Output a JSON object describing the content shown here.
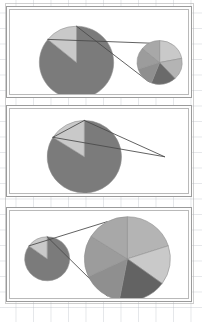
{
  "figure": {
    "width": 202,
    "height": 322,
    "background": "#ffffff",
    "grid_color": "#aab0ba",
    "panel_border_color": "#9b9b9b",
    "panel_inner_border_color": "#b9b9b9",
    "wedge_outline_color": "#8f8f8f",
    "leader_line_color": "#4a4a4a"
  },
  "palette": {
    "dark_gray": "#7b7b7b",
    "mid_gray": "#8f8f8f",
    "light_gray": "#c9c9c9",
    "lighter_gray": "#b4b4b4",
    "pale_gray": "#d6d6d6",
    "darkest_gray": "#6a6a6a",
    "very_dark_gray": "#636363"
  },
  "chart_data": [
    {
      "type": "pie",
      "panel": 1,
      "title": "Panel 1 — main pie with medium detail pie",
      "main_pie": {
        "name": "main",
        "center_x": 68,
        "center_y": 55,
        "radius": 38,
        "start_angle": -90,
        "slices": [
          {
            "label": "Remainder",
            "value": 86,
            "color": "#7b7b7b"
          },
          {
            "label": "Other",
            "value": 14,
            "color": "#c9c9c9"
          }
        ]
      },
      "detail_pie": {
        "name": "detail",
        "center_x": 153,
        "center_y": 55,
        "radius": 23,
        "start_angle": -90,
        "slices": [
          {
            "label": "A",
            "value": 22,
            "color": "#c9c9c9"
          },
          {
            "label": "B",
            "value": 16,
            "color": "#b4b4b4"
          },
          {
            "label": "C",
            "value": 18,
            "color": "#6a6a6a"
          },
          {
            "label": "D",
            "value": 14,
            "color": "#8f8f8f"
          },
          {
            "label": "E",
            "value": 16,
            "color": "#9c9c9c"
          },
          {
            "label": "F",
            "value": 14,
            "color": "#a8a8a8"
          }
        ]
      },
      "leader_lines": true,
      "legend": "none",
      "grid": false
    },
    {
      "type": "pie",
      "panel": 2,
      "title": "Panel 2 — main pie with collapsed detail pie",
      "main_pie": {
        "name": "main",
        "center_x": 76,
        "center_y": 50,
        "radius": 38,
        "start_angle": -90,
        "slices": [
          {
            "label": "Remainder",
            "value": 84,
            "color": "#7b7b7b"
          },
          {
            "label": "Other",
            "value": 16,
            "color": "#c9c9c9"
          }
        ]
      },
      "detail_pie": {
        "name": "detail",
        "center_x": 158,
        "center_y": 50,
        "radius": 0,
        "start_angle": -90,
        "slices": []
      },
      "leader_lines": true,
      "legend": "none",
      "grid": false
    },
    {
      "type": "pie",
      "panel": 3,
      "title": "Panel 3 — small main pie with large detail pie",
      "main_pie": {
        "name": "main",
        "center_x": 38,
        "center_y": 50,
        "radius": 23,
        "start_angle": -90,
        "slices": [
          {
            "label": "Remainder",
            "value": 85,
            "color": "#7b7b7b"
          },
          {
            "label": "Other",
            "value": 15,
            "color": "#c9c9c9"
          }
        ]
      },
      "detail_pie": {
        "name": "detail",
        "center_x": 120,
        "center_y": 50,
        "radius": 44,
        "start_angle": -90,
        "slices": [
          {
            "label": "A",
            "value": 20,
            "color": "#b4b4b4"
          },
          {
            "label": "B",
            "value": 15,
            "color": "#c9c9c9"
          },
          {
            "label": "C",
            "value": 18,
            "color": "#636363"
          },
          {
            "label": "D",
            "value": 15,
            "color": "#8f8f8f"
          },
          {
            "label": "E",
            "value": 16,
            "color": "#9c9c9c"
          },
          {
            "label": "F",
            "value": 16,
            "color": "#a8a8a8"
          }
        ]
      },
      "leader_lines": true,
      "legend": "none",
      "grid": false
    }
  ],
  "panels": [
    {
      "name": "panel-1",
      "x": 6,
      "y": 6,
      "width": 186,
      "height": 92
    },
    {
      "name": "panel-2",
      "x": 6,
      "y": 105,
      "width": 186,
      "height": 92
    },
    {
      "name": "panel-3",
      "x": 6,
      "y": 207,
      "width": 186,
      "height": 95
    }
  ]
}
